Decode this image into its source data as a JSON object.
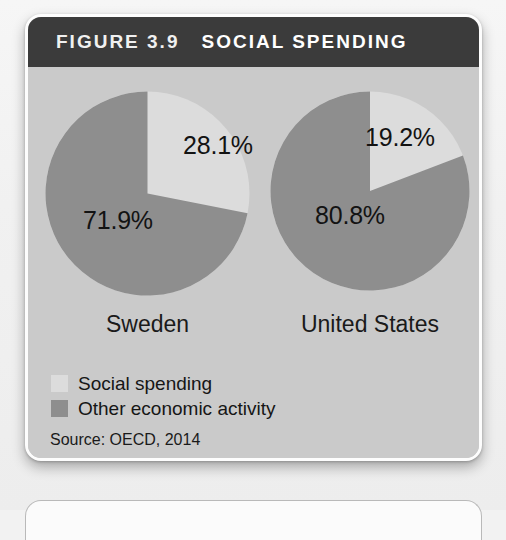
{
  "figure": {
    "label": "FIGURE 3.9",
    "title": "SOCIAL SPENDING",
    "source": "Source: OECD, 2014"
  },
  "legend": {
    "items": [
      {
        "label": "Social spending",
        "color": "#dcdcdc"
      },
      {
        "label": "Other economic activity",
        "color": "#8e8e8e"
      }
    ]
  },
  "colors": {
    "header_bg": "#3b3b3b",
    "panel_bg": "#cacaca",
    "social_spending": "#dcdcdc",
    "other_activity": "#8e8e8e",
    "text": "#131313"
  },
  "chart_data": [
    {
      "type": "pie",
      "title": "Sweden",
      "labels": [
        "Social spending",
        "Other economic activity"
      ],
      "values": [
        28.1,
        71.9
      ],
      "value_labels": [
        "28.1%",
        "71.9%"
      ],
      "colors": [
        "#dcdcdc",
        "#8e8e8e"
      ],
      "start_angle": 0,
      "direction": "clockwise",
      "units": "percent",
      "legend_position": "bottom-left"
    },
    {
      "type": "pie",
      "title": "United States",
      "labels": [
        "Social spending",
        "Other economic activity"
      ],
      "values": [
        19.2,
        80.8
      ],
      "value_labels": [
        "19.2%",
        "80.8%"
      ],
      "colors": [
        "#dcdcdc",
        "#8e8e8e"
      ],
      "start_angle": 0,
      "direction": "clockwise",
      "units": "percent",
      "legend_position": "bottom-left"
    }
  ]
}
